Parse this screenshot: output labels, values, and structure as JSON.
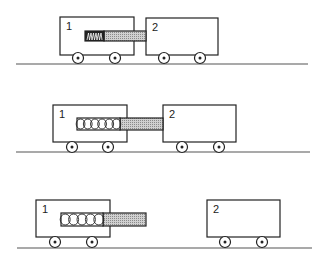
{
  "figure": {
    "colors": {
      "stroke": "#222222",
      "rod_fill": "#b8b8b8",
      "ground": "#555555",
      "background": "#ffffff"
    },
    "scenes": [
      {
        "name": "compressed",
        "ground": {
          "x1": 16,
          "x2": 308,
          "y": 64
        },
        "cart1": {
          "label": "1",
          "x": 60,
          "y": 17,
          "w": 74,
          "h": 38,
          "wheels": [
            78,
            115
          ]
        },
        "cart2": {
          "label": "2",
          "x": 146,
          "y": 18,
          "w": 72,
          "h": 37,
          "wheels": [
            164,
            200
          ]
        },
        "spring": {
          "x": 85,
          "w": 19,
          "y": 31,
          "h": 10,
          "coils": 6,
          "state": "compressed"
        },
        "rod": {
          "x": 104,
          "w": 42,
          "y": 31,
          "h": 10
        },
        "wheel_y": 58
      },
      {
        "name": "expanding",
        "ground": {
          "x1": 16,
          "x2": 310,
          "y": 152
        },
        "cart1": {
          "label": "1",
          "x": 53,
          "y": 105,
          "w": 74,
          "h": 37,
          "wheels": [
            72,
            108
          ]
        },
        "cart2": {
          "label": "2",
          "x": 163,
          "y": 105,
          "w": 73,
          "h": 37,
          "wheels": [
            182,
            219
          ]
        },
        "spring": {
          "x": 77,
          "w": 43,
          "y": 118,
          "h": 12,
          "coils": 6,
          "state": "extended"
        },
        "rod": {
          "x": 120,
          "w": 43,
          "y": 118,
          "h": 12
        },
        "wheel_y": 147
      },
      {
        "name": "separated",
        "ground": {
          "x1": 17,
          "x2": 312,
          "y": 248
        },
        "cart1": {
          "label": "1",
          "x": 36,
          "y": 200,
          "w": 74,
          "h": 37,
          "wheels": [
            55,
            92
          ]
        },
        "cart2": {
          "label": "2",
          "x": 207,
          "y": 200,
          "w": 73,
          "h": 37,
          "wheels": [
            225,
            262
          ]
        },
        "spring": {
          "x": 61,
          "w": 42,
          "y": 213,
          "h": 13,
          "coils": 5,
          "state": "extended"
        },
        "rod": {
          "x": 103,
          "w": 43,
          "y": 213,
          "h": 13
        },
        "wheel_y": 242
      }
    ]
  }
}
